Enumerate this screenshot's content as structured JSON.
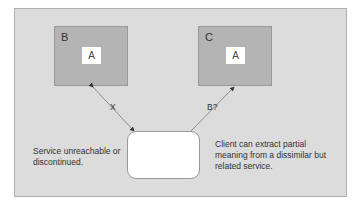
{
  "diagram": {
    "services": [
      {
        "id": "B",
        "label": "B",
        "inner": "A"
      },
      {
        "id": "C",
        "label": "C",
        "inner": "A"
      }
    ],
    "client": {
      "label": ""
    },
    "edges": [
      {
        "from": "client",
        "to": "B",
        "label": "X"
      },
      {
        "from": "client",
        "to": "C",
        "label": "B?"
      }
    ],
    "notes": {
      "left": "Service unreachable or discontinued.",
      "right": "Client can extract partial meaning from a dissimilar but related service."
    }
  }
}
